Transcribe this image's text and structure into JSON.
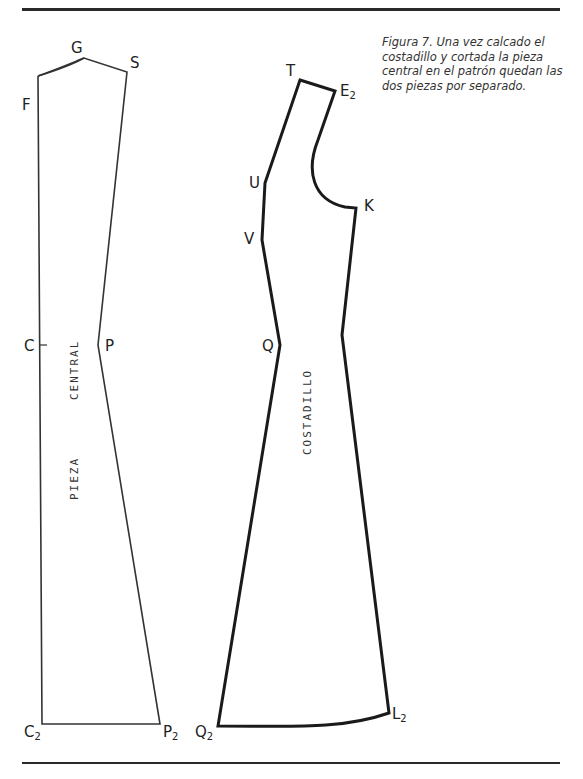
{
  "figure": {
    "caption": "Figura 7. Una vez calcado el costadillo y cortada la pieza central en el patrón quedan las dos piezas por separado.",
    "caption_lines": [
      "Figura 7. Una vez calcado el",
      "costadillo y cortada la pieza",
      "central en el patrón quedan las",
      "dos piezas por separado."
    ]
  },
  "pieces": {
    "central": {
      "name_line1": "CENTRAL",
      "name_line2": "PIEZA",
      "stroke_color": "#333333",
      "points": {
        "F": "F",
        "G": "G",
        "S": "S",
        "C": "C",
        "P": "P",
        "C2": {
          "base": "C",
          "sub": "2"
        },
        "P2": {
          "base": "P",
          "sub": "2"
        }
      }
    },
    "costadillo": {
      "name": "COSTADILLO",
      "stroke_color": "#1a1a1a",
      "points": {
        "T": "T",
        "U": "U",
        "V": "V",
        "Q": "Q",
        "K": "K",
        "E2": {
          "base": "E",
          "sub": "2"
        },
        "L2": {
          "base": "L",
          "sub": "2"
        },
        "Q2": {
          "base": "Q",
          "sub": "2"
        }
      }
    }
  }
}
